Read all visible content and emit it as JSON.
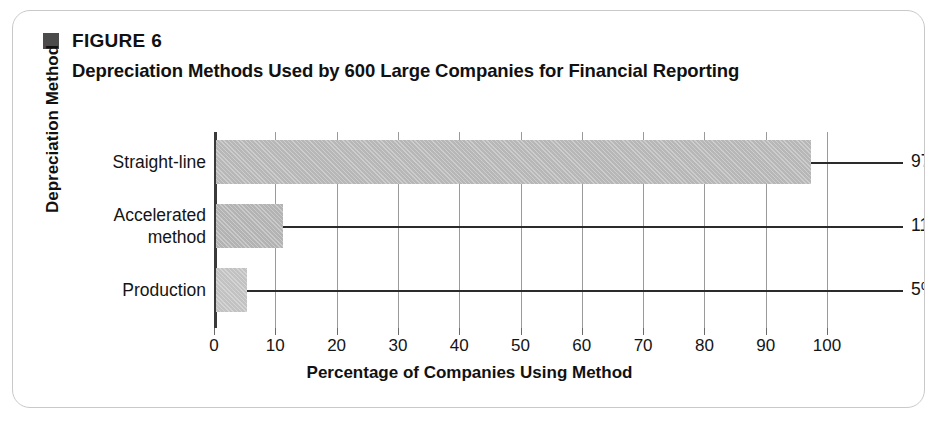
{
  "figure": {
    "marker": "square-marker",
    "number": "FIGURE 6",
    "title": "Depreciation Methods Used by 600 Large Companies for Financial Reporting"
  },
  "chart_data": {
    "type": "bar",
    "orientation": "horizontal",
    "title": "Depreciation Methods Used by 600 Large Companies for Financial Reporting",
    "xlabel": "Percentage of Companies Using Method",
    "ylabel": "Depreciation Method",
    "categories": [
      "Straight-line",
      "Accelerated\nmethod",
      "Production"
    ],
    "values": [
      97,
      11,
      5
    ],
    "value_labels": [
      "97%",
      "11%",
      "5%"
    ],
    "xlim": [
      0,
      100
    ],
    "xticks": [
      0,
      10,
      20,
      30,
      40,
      50,
      60,
      70,
      80,
      90,
      100
    ],
    "xtick_labels": [
      "0",
      "10",
      "20",
      "30",
      "40",
      "50",
      "60",
      "70",
      "80",
      "90",
      "100"
    ],
    "grid": "vertical",
    "legend": "none",
    "bar_color": "#b9b9b9",
    "axis_color": "#3a3a3a",
    "gridline_color": "#9a9a9a",
    "leader_line_color": "#2b2b2b",
    "text_color": "#141414"
  },
  "card": {
    "border_color": "#c9c9c9",
    "background": "#ffffff"
  }
}
